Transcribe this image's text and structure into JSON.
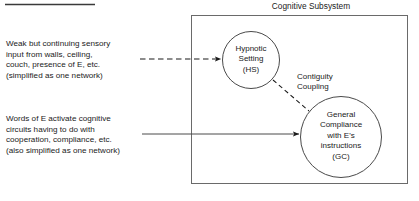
{
  "figure": {
    "background_color": "#ffffff",
    "ink_color": "#1a1a1a",
    "top_rule": {
      "name": "horizontal-rule",
      "x1": 5,
      "y1": 4,
      "x2": 95,
      "y2": 4
    }
  },
  "subsystem": {
    "title": "Cognitive Subsystem",
    "box": {
      "x": 191,
      "y": 15,
      "width": 217,
      "height": 169
    }
  },
  "left_annotations": [
    {
      "id": "sensory-input-note",
      "lines": [
        "Weak but continuing sensory",
        "input from walls, ceiling,",
        "couch, presence of E, etc.",
        "(simplified as one network)"
      ],
      "text": "Weak but continuing sensory\ninput from walls, ceiling,\ncouch, presence of E, etc.\n(simplified as one network)"
    },
    {
      "id": "words-of-e-note",
      "lines": [
        "Words of E activate cognitive",
        "circuits having to do with",
        "cooperation, compliance, etc.",
        "(also simplified as one network)"
      ],
      "text": "Words of E activate cognitive\ncircuits having to do with\ncooperation, compliance, etc.\n(also simplified as one network)"
    }
  ],
  "nodes": [
    {
      "id": "hypnotic-setting",
      "abbreviation": "HS",
      "label": "Hypnotic\nSetting\n(HS)",
      "lines": [
        "Hypnotic",
        "Setting",
        "(HS)"
      ],
      "shape": "circle",
      "cx": 251,
      "cy": 60,
      "r": 29
    },
    {
      "id": "general-compliance",
      "abbreviation": "GC",
      "label": "General\nCompliance\nwith E's\ninstructions\n(GC)",
      "lines": [
        "General",
        "Compliance",
        "with E's",
        "instructions",
        "(GC)"
      ],
      "shape": "circle",
      "cx": 341,
      "cy": 137,
      "r": 41
    }
  ],
  "connectors": [
    {
      "id": "sensory-to-hs",
      "style": "dashed",
      "arrowhead": true,
      "from": {
        "x": 140,
        "y": 59
      },
      "to": {
        "x": 222,
        "y": 59
      }
    },
    {
      "id": "words-to-gc",
      "style": "solid",
      "arrowhead": true,
      "from": {
        "x": 142,
        "y": 134
      },
      "to": {
        "x": 300,
        "y": 134
      }
    },
    {
      "id": "contiguity-coupling-link",
      "style": "dashed",
      "arrowhead": false,
      "label": "Contiguity\nCoupling",
      "label_lines": [
        "Contiguity",
        "Coupling"
      ],
      "from": {
        "x": 273,
        "y": 80
      },
      "to": {
        "x": 309,
        "y": 111
      }
    }
  ]
}
